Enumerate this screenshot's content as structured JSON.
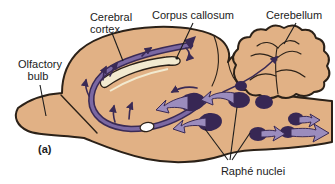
{
  "figure": {
    "panel_label": "(a)",
    "labels": {
      "cerebral_cortex": [
        "Cerebral",
        "cortex"
      ],
      "corpus_callosum": "Corpus callosum",
      "cerebellum": "Cerebellum",
      "olfactory_bulb": [
        "Olfactory",
        "bulb"
      ],
      "raphe_nuclei": "Raphé nuclei"
    },
    "colors": {
      "background": "#ffffff",
      "brain_fill": "#e1b185",
      "outline": "#2b2118",
      "pathway_dark": "#3a2a55",
      "pathway_light": "#7b68a2",
      "arrow_fill": "#9b8cbd",
      "nucleus_fill": "#372754",
      "corpus_callosum_fill": "#f2ead0",
      "label_text": "#1c1c1c"
    }
  }
}
